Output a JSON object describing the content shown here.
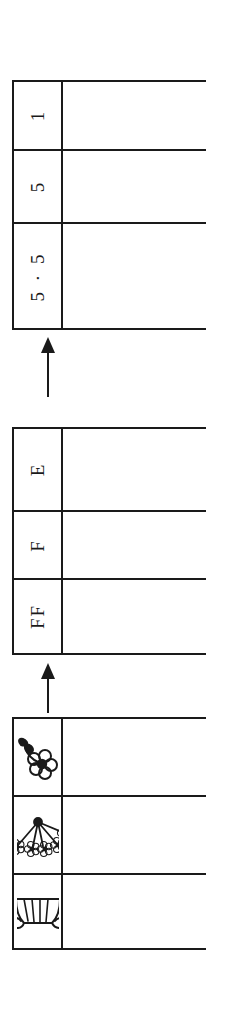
{
  "diagram": {
    "orientation": "rotated-90-ccw",
    "ink_color": "#1a1a1a",
    "paper_color": "#ffffff",
    "tables": [
      {
        "id": "numeric-table",
        "name": "numeric-notation-table",
        "rows": [
          {
            "label": "1",
            "kind": "text",
            "blank_cell": ""
          },
          {
            "label": "5",
            "kind": "text",
            "blank_cell": ""
          },
          {
            "label": "5 · 5",
            "kind": "text",
            "blank_cell": ""
          }
        ]
      },
      {
        "id": "letter-table",
        "name": "letter-notation-table",
        "rows": [
          {
            "label": "E",
            "kind": "text",
            "blank_cell": ""
          },
          {
            "label": "F",
            "kind": "text",
            "blank_cell": ""
          },
          {
            "label": "FF",
            "kind": "text",
            "blank_cell": ""
          }
        ]
      },
      {
        "id": "picture-table",
        "name": "flower-picture-table",
        "rows": [
          {
            "label": "single-flower-icon",
            "kind": "icon",
            "icon": "single-flower-icon",
            "blank_cell": ""
          },
          {
            "label": "flower-bouquet-icon",
            "kind": "icon",
            "icon": "flower-bouquet-icon",
            "blank_cell": ""
          },
          {
            "label": "flower-sheaf-icon",
            "kind": "icon",
            "icon": "flower-sheaf-icon",
            "blank_cell": ""
          }
        ]
      }
    ],
    "arrows": [
      {
        "id": "arrow-letters-to-numbers",
        "name": "arrow-up-letters-to-numbers",
        "direction": "up"
      },
      {
        "id": "arrow-pictures-to-letters",
        "name": "arrow-up-pictures-to-letters",
        "direction": "up"
      }
    ]
  }
}
